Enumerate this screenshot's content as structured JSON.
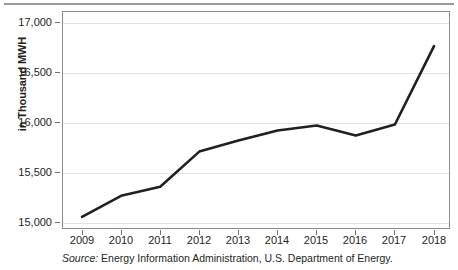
{
  "figure": {
    "y_axis_title": "in Thousand MWH",
    "source_prefix": "Source:",
    "source_text": "Energy Information Administration, U.S. Department of Energy.",
    "line_color": "#231f20",
    "grid_color": "#e3e3e3",
    "frame_color": "#8d8d8d",
    "rule_color": "#9a9a9a"
  },
  "chart_data": {
    "type": "line",
    "title": "",
    "xlabel": "",
    "ylabel": "in Thousand MWH",
    "categories": [
      "2009",
      "2010",
      "2011",
      "2012",
      "2013",
      "2014",
      "2015",
      "2016",
      "2017",
      "2018"
    ],
    "x": [
      2009,
      2010,
      2011,
      2012,
      2013,
      2014,
      2015,
      2016,
      2017,
      2018
    ],
    "values": [
      15000,
      15210,
      15300,
      15650,
      15760,
      15860,
      15910,
      15810,
      15920,
      16700
    ],
    "series": [
      {
        "name": "Electricity Generation",
        "values": [
          15000,
          15210,
          15300,
          15650,
          15760,
          15860,
          15910,
          15810,
          15920,
          16700
        ]
      }
    ],
    "ylim": [
      14880,
      17050
    ],
    "ytick_labels": [
      "17,000",
      "16,500",
      "16,000",
      "15,500",
      "15,000"
    ],
    "ytick_values": [
      17000,
      16500,
      16000,
      15500,
      15000
    ],
    "xtick_labels": [
      "2009",
      "2010",
      "2011",
      "2012",
      "2013",
      "2014",
      "2015",
      "2016",
      "2017",
      "2018"
    ],
    "grid": "horizontal",
    "legend": "none",
    "annotations": []
  }
}
